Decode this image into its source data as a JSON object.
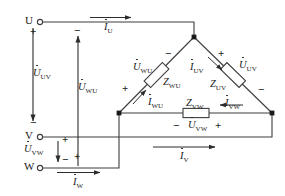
{
  "diagram": {
    "line_color": "#3d3d3d",
    "text_color": "#1a1a1a"
  },
  "terminals": [
    {
      "name": "terminal-u",
      "label": "U"
    },
    {
      "name": "terminal-v",
      "label": "V"
    },
    {
      "name": "terminal-w",
      "label": "W"
    }
  ],
  "line_voltages": {
    "uv": {
      "symbol": "U",
      "subscript": "UV",
      "plus": "+",
      "minus": "−"
    },
    "wu": {
      "symbol": "U",
      "subscript": "WU",
      "plus": "+",
      "minus": "−"
    },
    "vw": {
      "symbol": "U",
      "subscript": "VW",
      "plus": "+",
      "minus": "−"
    }
  },
  "line_currents": {
    "iu": {
      "symbol": "I",
      "subscript": "U"
    },
    "iv": {
      "symbol": "I",
      "subscript": "V"
    },
    "iw": {
      "symbol": "I",
      "subscript": "W"
    }
  },
  "phase_branches": [
    {
      "name": "branch-wu",
      "impedance": {
        "symbol": "Z",
        "subscript": "WU"
      },
      "voltage": {
        "symbol": "U",
        "subscript": "WU"
      },
      "current": {
        "symbol": "I",
        "subscript": "WU"
      },
      "plus": "+",
      "minus": "−"
    },
    {
      "name": "branch-uv",
      "impedance": {
        "symbol": "Z",
        "subscript": "UV"
      },
      "voltage": {
        "symbol": "U",
        "subscript": "UV"
      },
      "current": {
        "symbol": "I",
        "subscript": "UV"
      },
      "plus": "+",
      "minus": "−"
    },
    {
      "name": "branch-vw",
      "impedance": {
        "symbol": "Z",
        "subscript": "VW"
      },
      "voltage": {
        "symbol": "U",
        "subscript": "VW"
      },
      "current": {
        "symbol": "I",
        "subscript": "VW"
      },
      "plus": "+",
      "minus": "−"
    }
  ]
}
